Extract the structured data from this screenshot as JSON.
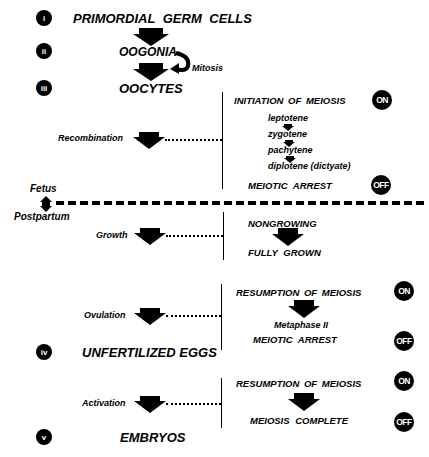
{
  "stages": [
    {
      "numeral": "i",
      "label": "PRIMORDIAL GERM CELLS"
    },
    {
      "numeral": "ii",
      "label": "OOGONIA"
    },
    {
      "numeral": "iii",
      "label": "OOCYTES"
    },
    {
      "numeral": "iv",
      "label": "UNFERTILIZED EGGS"
    },
    {
      "numeral": "v",
      "label": "EMBRYOS"
    }
  ],
  "mitosis_label": "Mitosis",
  "divider": {
    "above": "Fetus",
    "below": "Postpartum"
  },
  "processes": [
    {
      "label": "Recombination"
    },
    {
      "label": "Growth"
    },
    {
      "label": "Ovulation"
    },
    {
      "label": "Activation"
    }
  ],
  "meiosis": {
    "initiation": {
      "title": "INITIATION OF MEIOSIS",
      "state": "ON",
      "substages": [
        "leptotene",
        "zygotene",
        "pachytene",
        "diplotene (dictyate)"
      ],
      "arrest": "MEIOTIC ARREST",
      "arrest_state": "OFF"
    },
    "growth": {
      "start": "NONGROWING",
      "end": "FULLY GROWN"
    },
    "ovulation": {
      "title": "RESUMPTION OF MEIOSIS",
      "state": "ON",
      "mid": "Metaphase II",
      "arrest": "MEIOTIC ARREST",
      "arrest_state": "OFF"
    },
    "activation": {
      "title": "RESUMPTION OF MEIOSIS",
      "state": "ON",
      "end": "MEIOSIS COMPLETE",
      "end_state": "OFF"
    }
  }
}
